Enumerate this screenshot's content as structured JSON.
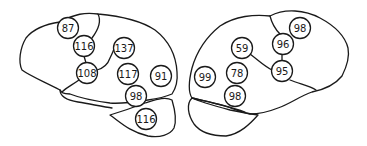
{
  "diagram": {
    "title": "",
    "hemispheres": [
      {
        "name": "left-hemisphere-lateral",
        "regions": [
          {
            "id": "l1",
            "label": "87"
          },
          {
            "id": "l2",
            "label": "116"
          },
          {
            "id": "l3",
            "label": "137"
          },
          {
            "id": "l4",
            "label": "108"
          },
          {
            "id": "l5",
            "label": "117"
          },
          {
            "id": "l6",
            "label": "91"
          },
          {
            "id": "l7",
            "label": "98"
          },
          {
            "id": "l8",
            "label": "116"
          }
        ]
      },
      {
        "name": "right-hemisphere-lateral",
        "regions": [
          {
            "id": "r1",
            "label": "98"
          },
          {
            "id": "r2",
            "label": "96"
          },
          {
            "id": "r3",
            "label": "59"
          },
          {
            "id": "r4",
            "label": "95"
          },
          {
            "id": "r5",
            "label": "99"
          },
          {
            "id": "r6",
            "label": "78"
          },
          {
            "id": "r7",
            "label": "98"
          }
        ]
      }
    ]
  }
}
